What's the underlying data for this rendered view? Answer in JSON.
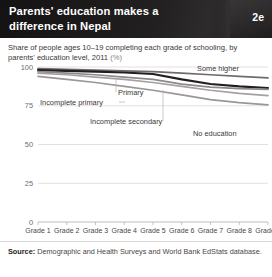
{
  "header": {
    "title": "Parents' education makes a difference in Nepal",
    "badge": "2e"
  },
  "subtitle": {
    "main": "Share of people ages 10–19 completing each grade of schooling, by parents' education level, 2011",
    "unit": "(%)"
  },
  "footer": {
    "source_label": "Source:",
    "source_text": "Demographic and Health Surveys and World Bank EdStats database."
  },
  "chart_data": {
    "type": "line",
    "title": "Share of people ages 10–19 completing each grade of schooling, by parents' education level, 2011 (%)",
    "xlabel": "",
    "ylabel": "",
    "ylim": [
      0,
      100
    ],
    "yticks": [
      0,
      25,
      50,
      75,
      100
    ],
    "ytick_labels": [
      "0",
      "25",
      "50",
      "75",
      "100"
    ],
    "grid": true,
    "legend": "inline-annotations",
    "categories": [
      "Grade 1",
      "Grade 2",
      "Grade 3",
      "Grade 4",
      "Grade 5",
      "Grade 6",
      "Grade 7",
      "Grade 8",
      "Grade 9"
    ],
    "series": [
      {
        "name": "Some higher",
        "color": "#6f6b6c",
        "values": [
          99,
          98.5,
          98,
          97.5,
          97,
          96,
          95,
          94,
          93
        ]
      },
      {
        "name": "Primary",
        "color": "#231f20",
        "values": [
          98,
          97.5,
          97,
          96.5,
          95.5,
          92,
          89,
          87.5,
          86.5
        ]
      },
      {
        "name": "Incomplete primary",
        "color": "#8d8889",
        "values": [
          97,
          96,
          95,
          93.5,
          92,
          89,
          87,
          86,
          85.5
        ]
      },
      {
        "name": "Incomplete secondary",
        "color": "#a5a0a1",
        "values": [
          96,
          95,
          93.5,
          92,
          90,
          87.5,
          85,
          83,
          81.5
        ]
      },
      {
        "name": "No education",
        "color": "#9b9697",
        "values": [
          94,
          92,
          90,
          87.5,
          85,
          82,
          79,
          77,
          75.5
        ]
      }
    ],
    "annotations": [
      {
        "text": "Some higher",
        "series": "Some higher"
      },
      {
        "text": "Primary",
        "series": "Primary"
      },
      {
        "text": "Incomplete primary",
        "series": "Incomplete primary"
      },
      {
        "text": "Incomplete secondary",
        "series": "Incomplete secondary"
      },
      {
        "text": "No education",
        "series": "No education"
      }
    ]
  }
}
